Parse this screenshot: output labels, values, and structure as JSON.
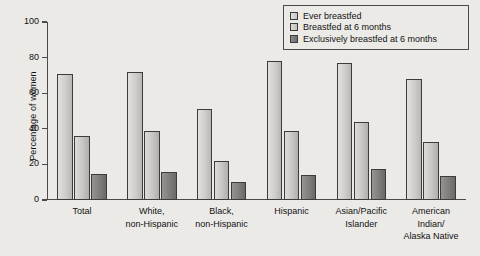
{
  "chart_data": {
    "type": "bar",
    "title": "",
    "xlabel": "",
    "ylabel": "Percentage of women",
    "ylim": [
      0,
      100
    ],
    "yticks": [
      0,
      20,
      40,
      60,
      80,
      100
    ],
    "grid": false,
    "legend_position": "top-right",
    "categories": [
      "Total",
      "White,\nnon-Hispanic",
      "Black,\nnon-Hispanic",
      "Hispanic",
      "Asian/Pacific\nIslander",
      "American\nIndian/\nAlaska Native"
    ],
    "series": [
      {
        "name": "Ever breastfed",
        "values": [
          71,
          72,
          51,
          78,
          77,
          68
        ]
      },
      {
        "name": "Breastfed at 6 months",
        "values": [
          36,
          38.5,
          22,
          38.5,
          44,
          32.5
        ]
      },
      {
        "name": "Exclusively breastfed at 6 months",
        "values": [
          14.5,
          16,
          10,
          14,
          17.5,
          13.5
        ]
      }
    ]
  },
  "legend": {
    "items": [
      {
        "label": "Ever breastfed",
        "color": "#cfcdc9"
      },
      {
        "label": "Breastfed at 6 months",
        "color": "#c8c6c2"
      },
      {
        "label": "Exclusively breastfed at 6 months",
        "color": "#7f7d79"
      }
    ]
  },
  "axis": {
    "y_title": "Percentage of women",
    "y_tick_labels": [
      "0",
      "20",
      "40",
      "60",
      "80",
      "100"
    ]
  },
  "colors": {
    "background": "#eceae7",
    "axis": "#4a4a4a",
    "bar_border": "#3c3c3c",
    "text": "#111111"
  }
}
